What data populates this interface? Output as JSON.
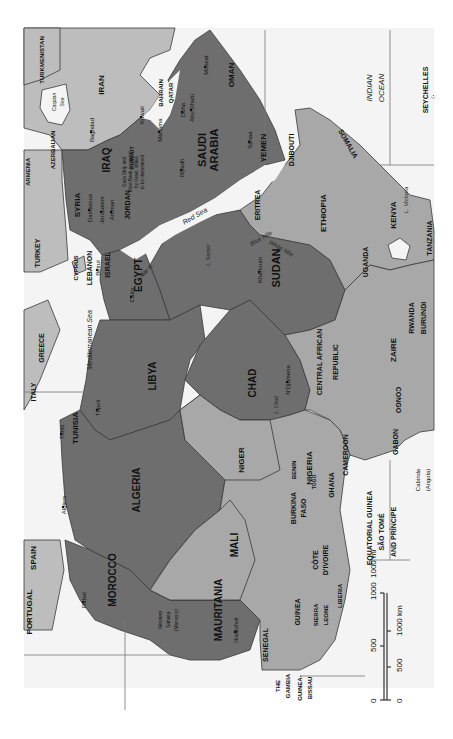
{
  "map": {
    "orientation": "rotated 90 degrees clockwise (north to the left)",
    "regions": {
      "highlighted_dark": [
        "MOROCCO",
        "ALGERIA",
        "TUNISIA",
        "LIBYA",
        "EGYPT",
        "SUDAN",
        "CHAD",
        "MAURITANIA",
        "SYRIA",
        "IRAQ",
        "JORDAN",
        "SAUDI ARABIA",
        "KUWAIT",
        "YEMEN",
        "OMAN"
      ],
      "other": [
        "TURKEY",
        "IRAN",
        "ETHIOPIA",
        "SOMALIA",
        "KENYA",
        "NIGER",
        "MALI",
        "NIGERIA"
      ]
    },
    "countries": [
      {
        "name": "PORTUGAL",
        "x": 32,
        "y": 612,
        "rot": -90,
        "size": 8
      },
      {
        "name": "SPAIN",
        "x": 36,
        "y": 558,
        "rot": -90,
        "size": 8
      },
      {
        "name": "MOROCCO",
        "x": 116,
        "y": 580,
        "rot": -90,
        "size": 10
      },
      {
        "name": "ALGERIA",
        "x": 140,
        "y": 490,
        "rot": -90,
        "size": 10
      },
      {
        "name": "TUNISIA",
        "x": 78,
        "y": 428,
        "rot": -90,
        "size": 8
      },
      {
        "name": "LIBYA",
        "x": 156,
        "y": 376,
        "rot": -90,
        "size": 10
      },
      {
        "name": "EGYPT",
        "x": 142,
        "y": 275,
        "rot": -90,
        "size": 10
      },
      {
        "name": "SUDAN",
        "x": 280,
        "y": 268,
        "rot": -90,
        "size": 11
      },
      {
        "name": "CHAD",
        "x": 256,
        "y": 383,
        "rot": -90,
        "size": 10
      },
      {
        "name": "NIGER",
        "x": 244,
        "y": 460,
        "rot": -90,
        "size": 8
      },
      {
        "name": "MALI",
        "x": 238,
        "y": 545,
        "rot": -90,
        "size": 10
      },
      {
        "name": "MAURITANIA",
        "x": 222,
        "y": 610,
        "rot": -90,
        "size": 10
      },
      {
        "name": "NIGERIA",
        "x": 312,
        "y": 468,
        "rot": -90,
        "size": 8
      },
      {
        "name": "CAMEROON",
        "x": 348,
        "y": 455,
        "rot": -90,
        "size": 7
      },
      {
        "name": "CENTRAL AFRICAN",
        "x": 322,
        "y": 362,
        "rot": -90,
        "size": 7
      },
      {
        "name": "REPUBLIC",
        "x": 338,
        "y": 362,
        "rot": -90,
        "size": 7
      },
      {
        "name": "ZAIRE",
        "x": 396,
        "y": 350,
        "rot": -90,
        "size": 8
      },
      {
        "name": "RWANDA",
        "x": 414,
        "y": 318,
        "rot": -90,
        "size": 7
      },
      {
        "name": "BURUNDI",
        "x": 426,
        "y": 318,
        "rot": -90,
        "size": 7
      },
      {
        "name": "CONGO",
        "x": 396,
        "y": 400,
        "rot": 90,
        "size": 7
      },
      {
        "name": "GABON",
        "x": 398,
        "y": 442,
        "rot": -90,
        "size": 7
      },
      {
        "name": "UGANDA",
        "x": 368,
        "y": 262,
        "rot": -90,
        "size": 7
      },
      {
        "name": "KENYA",
        "x": 396,
        "y": 215,
        "rot": -90,
        "size": 8
      },
      {
        "name": "TANZANIA",
        "x": 432,
        "y": 238,
        "rot": -90,
        "size": 7
      },
      {
        "name": "ETHIOPIA",
        "x": 326,
        "y": 213,
        "rot": -90,
        "size": 8
      },
      {
        "name": "ERITREA",
        "x": 260,
        "y": 205,
        "rot": -90,
        "size": 7
      },
      {
        "name": "DJIBOUTI",
        "x": 294,
        "y": 150,
        "rot": -90,
        "size": 7
      },
      {
        "name": "SOMALIA",
        "x": 346,
        "y": 145,
        "rot": 60,
        "size": 7
      },
      {
        "name": "YEMEN",
        "x": 266,
        "y": 148,
        "rot": -90,
        "size": 8
      },
      {
        "name": "OMAN",
        "x": 234,
        "y": 75,
        "rot": -90,
        "size": 8
      },
      {
        "name": "SAUDI",
        "x": 206,
        "y": 150,
        "rot": -90,
        "size": 11
      },
      {
        "name": "ARABIA",
        "x": 218,
        "y": 150,
        "rot": -90,
        "size": 11
      },
      {
        "name": "IRAN",
        "x": 104,
        "y": 85,
        "rot": -90,
        "size": 8
      },
      {
        "name": "IRAQ",
        "x": 110,
        "y": 160,
        "rot": -90,
        "size": 10
      },
      {
        "name": "SYRIA",
        "x": 80,
        "y": 205,
        "rot": -90,
        "size": 8
      },
      {
        "name": "JORDAN",
        "x": 130,
        "y": 205,
        "rot": -90,
        "size": 7
      },
      {
        "name": "KUWAIT",
        "x": 134,
        "y": 158,
        "rot": -90,
        "size": 6
      },
      {
        "name": "QATAR",
        "x": 173,
        "y": 93,
        "rot": -90,
        "size": 6
      },
      {
        "name": "BAHRAIN",
        "x": 163,
        "y": 93,
        "rot": -90,
        "size": 6
      },
      {
        "name": "TURKEY",
        "x": 40,
        "y": 253,
        "rot": -90,
        "size": 7
      },
      {
        "name": "ARMENIA",
        "x": 30,
        "y": 172,
        "rot": -90,
        "size": 6
      },
      {
        "name": "AZERBAIJAN",
        "x": 55,
        "y": 150,
        "rot": -90,
        "size": 6
      },
      {
        "name": "TURKMENISTAN",
        "x": 44,
        "y": 60,
        "rot": -90,
        "size": 6
      },
      {
        "name": "CYPRUS",
        "x": 78,
        "y": 268,
        "rot": -90,
        "size": 6
      },
      {
        "name": "LEBANON",
        "x": 92,
        "y": 268,
        "rot": -90,
        "size": 7
      },
      {
        "name": "ISRAEL",
        "x": 110,
        "y": 265,
        "rot": -90,
        "size": 7
      },
      {
        "name": "GREECE",
        "x": 44,
        "y": 348,
        "rot": -90,
        "size": 7
      },
      {
        "name": "ITALY",
        "x": 36,
        "y": 392,
        "rot": -90,
        "size": 7
      },
      {
        "name": "BURKINA",
        "x": 296,
        "y": 508,
        "rot": -90,
        "size": 7
      },
      {
        "name": "FASO",
        "x": 306,
        "y": 508,
        "rot": -90,
        "size": 7
      },
      {
        "name": "BENIN",
        "x": 296,
        "y": 470,
        "rot": -90,
        "size": 6
      },
      {
        "name": "GHANA",
        "x": 334,
        "y": 485,
        "rot": -90,
        "size": 7
      },
      {
        "name": "TOGO",
        "x": 316,
        "y": 482,
        "rot": -90,
        "size": 5
      },
      {
        "name": "CÔTE",
        "x": 318,
        "y": 560,
        "rot": -90,
        "size": 7
      },
      {
        "name": "D'IVOIRE",
        "x": 328,
        "y": 560,
        "rot": -90,
        "size": 7
      },
      {
        "name": "GUINEA",
        "x": 300,
        "y": 612,
        "rot": -90,
        "size": 7
      },
      {
        "name": "SIERRA",
        "x": 318,
        "y": 615,
        "rot": -90,
        "size": 6
      },
      {
        "name": "LEONE",
        "x": 328,
        "y": 615,
        "rot": -90,
        "size": 6
      },
      {
        "name": "LIBERIA",
        "x": 342,
        "y": 596,
        "rot": -90,
        "size": 6
      },
      {
        "name": "SENEGAL",
        "x": 268,
        "y": 645,
        "rot": -90,
        "size": 7
      },
      {
        "name": "THE",
        "x": 280,
        "y": 686,
        "rot": -90,
        "size": 6
      },
      {
        "name": "GAMBIA",
        "x": 290,
        "y": 686,
        "rot": -90,
        "size": 6
      },
      {
        "name": "GUINEA-",
        "x": 302,
        "y": 688,
        "rot": -90,
        "size": 6
      },
      {
        "name": "BISSAU",
        "x": 312,
        "y": 688,
        "rot": -90,
        "size": 6
      },
      {
        "name": "EQUATORIAL GUINEA",
        "x": 372,
        "y": 528,
        "rot": -90,
        "size": 7
      },
      {
        "name": "SÃO TOMÉ",
        "x": 384,
        "y": 532,
        "rot": -90,
        "size": 7
      },
      {
        "name": "AND PRÍNCIPE",
        "x": 396,
        "y": 532,
        "rot": -90,
        "size": 7
      },
      {
        "name": "SEYCHELLES",
        "x": 428,
        "y": 90,
        "rot": -90,
        "size": 7
      }
    ],
    "annotations": [
      {
        "text": "Western",
        "x": 162,
        "y": 620,
        "rot": -90,
        "size": 5
      },
      {
        "text": "Sahara",
        "x": 170,
        "y": 620,
        "rot": -90,
        "size": 5
      },
      {
        "text": "(Morocco)",
        "x": 178,
        "y": 620,
        "rot": -90,
        "size": 5
      },
      {
        "text": "Cabinda",
        "x": 420,
        "y": 480,
        "rot": -90,
        "size": 6
      },
      {
        "text": "(Angola)",
        "x": 430,
        "y": 480,
        "rot": -90,
        "size": 6
      },
      {
        "text": "Gaza Strip and",
        "x": 126,
        "y": 172,
        "rot": -90,
        "size": 4.5
      },
      {
        "text": "West Bank occupied",
        "x": 132,
        "y": 172,
        "rot": -90,
        "size": 4.5
      },
      {
        "text": "by Israel; status",
        "x": 138,
        "y": 172,
        "rot": -90,
        "size": 4.5
      },
      {
        "text": "to be determined",
        "x": 144,
        "y": 172,
        "rot": -90,
        "size": 4.5
      }
    ],
    "cities": [
      {
        "name": "Rabat",
        "x": 86,
        "y": 600,
        "rot": -90,
        "size": 6
      },
      {
        "name": "Algiers",
        "x": 66,
        "y": 505,
        "rot": -90,
        "size": 6
      },
      {
        "name": "Tunis",
        "x": 64,
        "y": 432,
        "rot": -90,
        "size": 6
      },
      {
        "name": "Tripoli",
        "x": 100,
        "y": 408,
        "rot": -90,
        "size": 6
      },
      {
        "name": "Cairo",
        "x": 134,
        "y": 295,
        "rot": -90,
        "size": 6
      },
      {
        "name": "Khartoum",
        "x": 262,
        "y": 270,
        "rot": -90,
        "size": 6
      },
      {
        "name": "N'Djamena",
        "x": 290,
        "y": 380,
        "rot": -90,
        "size": 6
      },
      {
        "name": "Nouakchott",
        "x": 238,
        "y": 630,
        "rot": -90,
        "size": 5
      },
      {
        "name": "Damascus",
        "x": 92,
        "y": 208,
        "rot": -90,
        "size": 6
      },
      {
        "name": "Jerusalem",
        "x": 104,
        "y": 210,
        "rot": -90,
        "size": 6
      },
      {
        "name": "Amman",
        "x": 114,
        "y": 210,
        "rot": -90,
        "size": 6
      },
      {
        "name": "Beirut",
        "x": 100,
        "y": 268,
        "rot": -90,
        "size": 6
      },
      {
        "name": "Baghdad",
        "x": 94,
        "y": 130,
        "rot": -90,
        "size": 6
      },
      {
        "name": "Kuwait",
        "x": 144,
        "y": 115,
        "rot": -90,
        "size": 6
      },
      {
        "name": "Manama",
        "x": 162,
        "y": 130,
        "rot": -90,
        "size": 6
      },
      {
        "name": "Doha",
        "x": 185,
        "y": 110,
        "rot": -90,
        "size": 6
      },
      {
        "name": "Abu Dhabi",
        "x": 194,
        "y": 108,
        "rot": -90,
        "size": 6
      },
      {
        "name": "Muscat",
        "x": 208,
        "y": 65,
        "rot": -90,
        "size": 6
      },
      {
        "name": "Riyadh",
        "x": 184,
        "y": 168,
        "rot": -90,
        "size": 6
      },
      {
        "name": "Sanaa",
        "x": 252,
        "y": 140,
        "rot": -90,
        "size": 6
      }
    ],
    "water": [
      {
        "name": "INDIAN",
        "x": 372,
        "y": 88,
        "rot": -90,
        "size": 8,
        "italic": true
      },
      {
        "name": "OCEAN",
        "x": 384,
        "y": 88,
        "rot": -90,
        "size": 8,
        "italic": true
      },
      {
        "name": "Mediterranean Sea",
        "x": 92,
        "y": 340,
        "rot": -90,
        "size": 7,
        "italic": true
      },
      {
        "name": "Red Sea",
        "x": 196,
        "y": 218,
        "rot": -30,
        "size": 7,
        "italic": true
      },
      {
        "name": "Caspian",
        "x": 56,
        "y": 102,
        "rot": -90,
        "size": 5,
        "italic": true
      },
      {
        "name": "Sea",
        "x": 64,
        "y": 102,
        "rot": -90,
        "size": 5,
        "italic": true
      },
      {
        "name": "Nile R.",
        "x": 148,
        "y": 272,
        "rot": -45,
        "size": 6,
        "italic": true
      },
      {
        "name": "Blue Nile",
        "x": 262,
        "y": 240,
        "rot": -30,
        "size": 6,
        "italic": true
      },
      {
        "name": "White Nile",
        "x": 280,
        "y": 250,
        "rot": 30,
        "size": 6,
        "italic": true
      },
      {
        "name": "L. Nasser",
        "x": 210,
        "y": 255,
        "rot": -90,
        "size": 5,
        "italic": true
      },
      {
        "name": "L. Chad",
        "x": 278,
        "y": 405,
        "rot": -90,
        "size": 5,
        "italic": true
      },
      {
        "name": "L. Victoria",
        "x": 408,
        "y": 200,
        "rot": -90,
        "size": 6,
        "italic": true
      }
    ],
    "scale_bar": {
      "miles": {
        "unit_label": "1000 mi",
        "ticks": [
          "0",
          "500",
          "1000"
        ]
      },
      "km": {
        "unit_label": "1000 km",
        "ticks": [
          "0",
          "500",
          "1000"
        ]
      }
    }
  }
}
